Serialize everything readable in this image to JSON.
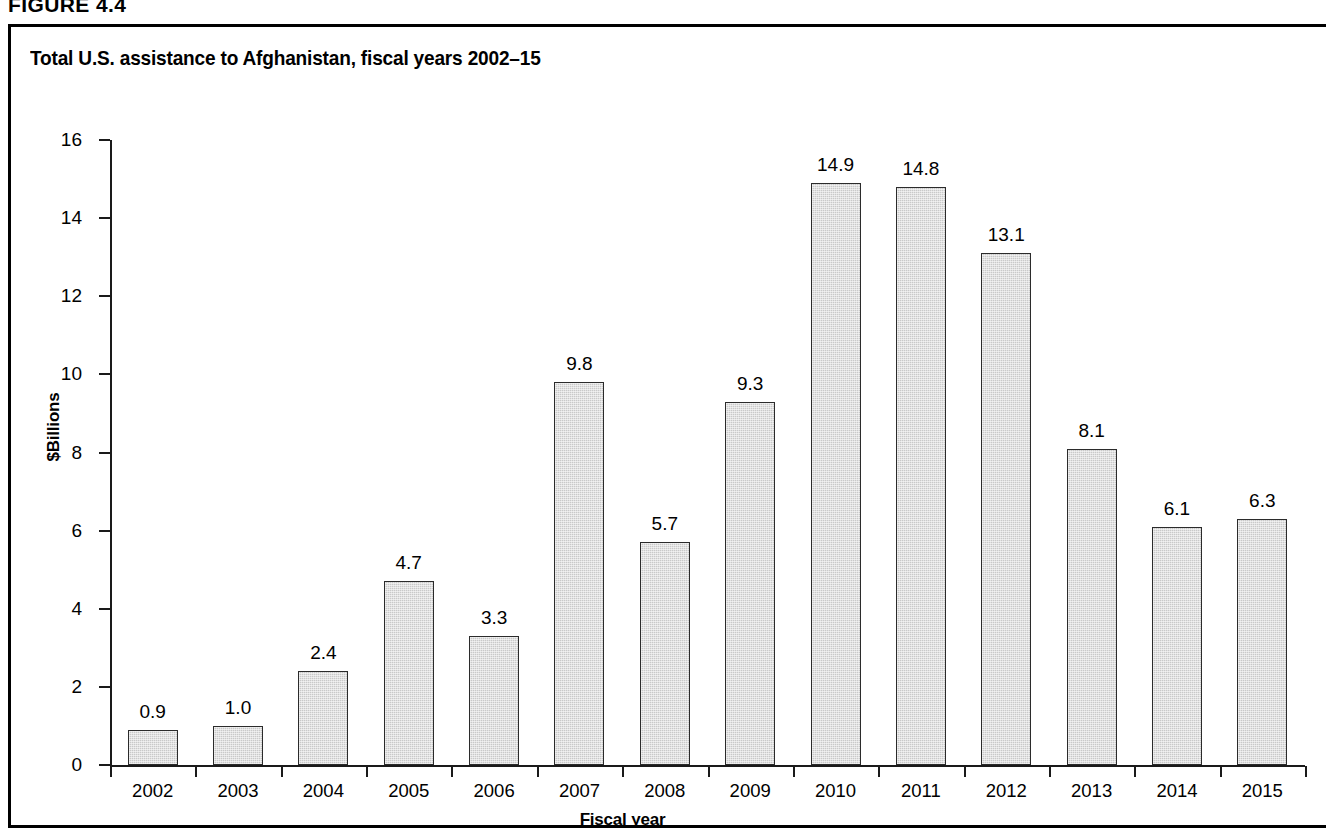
{
  "figure": {
    "header": "FIGURE 4.4",
    "title": "Total U.S. assistance to Afghanistan, fiscal years 2002–15"
  },
  "chart_data": {
    "type": "bar",
    "title": "Total U.S. assistance to Afghanistan, fiscal years 2002–15",
    "xlabel": "Fiscal year",
    "ylabel": "$Billions",
    "categories": [
      "2002",
      "2003",
      "2004",
      "2005",
      "2006",
      "2007",
      "2008",
      "2009",
      "2010",
      "2011",
      "2012",
      "2013",
      "2014",
      "2015"
    ],
    "values": [
      0.9,
      1.0,
      2.4,
      4.7,
      3.3,
      9.8,
      5.7,
      9.3,
      14.9,
      14.8,
      13.1,
      8.1,
      6.1,
      6.3
    ],
    "value_labels": [
      "0.9",
      "1.0",
      "2.4",
      "4.7",
      "3.3",
      "9.8",
      "5.7",
      "9.3",
      "14.9",
      "14.8",
      "13.1",
      "8.1",
      "6.1",
      "6.3"
    ],
    "ylim": [
      0,
      16
    ],
    "yticks": [
      0,
      2,
      4,
      6,
      8,
      10,
      12,
      14,
      16
    ],
    "ytick_labels": [
      "0",
      "2",
      "4",
      "6",
      "8",
      "10",
      "12",
      "14",
      "16"
    ],
    "grid": false,
    "legend": null,
    "bar_fill_color": "#c9c9c9",
    "bar_border_color": "#2b2b2b",
    "axis_color": "#1a1a1a",
    "background_color": "#ffffff"
  }
}
